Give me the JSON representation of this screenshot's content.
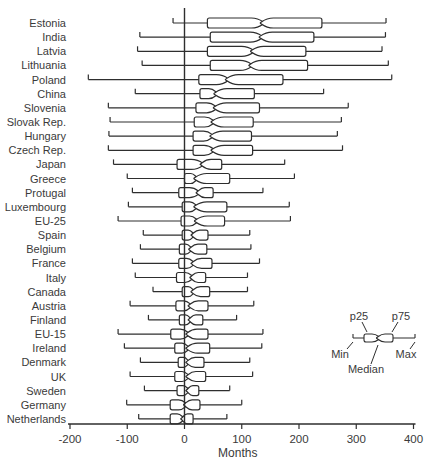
{
  "chart_data": {
    "type": "boxplot",
    "orientation": "horizontal",
    "title": "",
    "xlabel": "Months",
    "ylabel": "",
    "xlim": [
      -200,
      400
    ],
    "x_ticks": [
      -200,
      -100,
      0,
      100,
      200,
      300,
      400
    ],
    "grid": false,
    "zero_reference_line": 0,
    "categories": [
      "Estonia",
      "India",
      "Latvia",
      "Lithuania",
      "Poland",
      "China",
      "Slovenia",
      "Slovak Rep.",
      "Hungary",
      "Czech Rep.",
      "Japan",
      "Greece",
      "Protugal",
      "Luxembourg",
      "EU-25",
      "Spain",
      "Belgium",
      "France",
      "Italy",
      "Canada",
      "Austria",
      "Finland",
      "EU-15",
      "Ireland",
      "Denmark",
      "UK",
      "Sweden",
      "Germany",
      "Netherlands"
    ],
    "boxes": [
      {
        "label": "Estonia",
        "min": -20,
        "p25": 40,
        "median": 136,
        "p75": 240,
        "max": 352
      },
      {
        "label": "India",
        "min": -78,
        "p25": 45,
        "median": 134,
        "p75": 226,
        "max": 351
      },
      {
        "label": "Latvia",
        "min": -82,
        "p25": 40,
        "median": 119,
        "p75": 212,
        "max": 345
      },
      {
        "label": "Lithuania",
        "min": -74,
        "p25": 45,
        "median": 116,
        "p75": 215,
        "max": 356
      },
      {
        "label": "Poland",
        "min": -168,
        "p25": 25,
        "median": 75,
        "p75": 172,
        "max": 362
      },
      {
        "label": "China",
        "min": -86,
        "p25": 27,
        "median": 55,
        "p75": 122,
        "max": 243
      },
      {
        "label": "Slovenia",
        "min": -133,
        "p25": 20,
        "median": 54,
        "p75": 131,
        "max": 286
      },
      {
        "label": "Slovak Rep.",
        "min": -130,
        "p25": 17,
        "median": 50,
        "p75": 120,
        "max": 274
      },
      {
        "label": "Hungary",
        "min": -132,
        "p25": 15,
        "median": 48,
        "p75": 117,
        "max": 267
      },
      {
        "label": "Czech Rep.",
        "min": -133,
        "p25": 15,
        "median": 50,
        "p75": 119,
        "max": 276
      },
      {
        "label": "Japan",
        "min": -124,
        "p25": -13,
        "median": 31,
        "p75": 65,
        "max": 175
      },
      {
        "label": "Greece",
        "min": -100,
        "p25": 0,
        "median": 20,
        "p75": 79,
        "max": 192
      },
      {
        "label": "Protugal",
        "min": -91,
        "p25": -10,
        "median": 24,
        "p75": 50,
        "max": 137
      },
      {
        "label": "Luxembourg",
        "min": -98,
        "p25": -4,
        "median": 20,
        "p75": 74,
        "max": 183
      },
      {
        "label": "EU-25",
        "min": -116,
        "p25": -6,
        "median": 21,
        "p75": 70,
        "max": 185
      },
      {
        "label": "Spain",
        "min": -72,
        "p25": -4,
        "median": 15,
        "p75": 41,
        "max": 114
      },
      {
        "label": "Belgium",
        "min": -77,
        "p25": -9,
        "median": 11,
        "p75": 39,
        "max": 116
      },
      {
        "label": "France",
        "min": -91,
        "p25": -10,
        "median": 15,
        "p75": 48,
        "max": 131
      },
      {
        "label": "Italy",
        "min": -86,
        "p25": -14,
        "median": 13,
        "p75": 37,
        "max": 110
      },
      {
        "label": "Canada",
        "min": -55,
        "p25": -4,
        "median": 15,
        "p75": 44,
        "max": 110
      },
      {
        "label": "Austria",
        "min": -95,
        "p25": -15,
        "median": 10,
        "p75": 41,
        "max": 121
      },
      {
        "label": "Finland",
        "min": -63,
        "p25": -9,
        "median": 10,
        "p75": 32,
        "max": 91
      },
      {
        "label": "EU-15",
        "min": -116,
        "p25": -24,
        "median": 6,
        "p75": 41,
        "max": 137
      },
      {
        "label": "Ireland",
        "min": -105,
        "p25": -17,
        "median": 6,
        "p75": 44,
        "max": 135
      },
      {
        "label": "Denmark",
        "min": -77,
        "p25": -11,
        "median": 6,
        "p75": 34,
        "max": 114
      },
      {
        "label": "UK",
        "min": -95,
        "p25": -17,
        "median": 6,
        "p75": 37,
        "max": 119
      },
      {
        "label": "Sweden",
        "min": -70,
        "p25": -13,
        "median": 6,
        "p75": 25,
        "max": 79
      },
      {
        "label": "Germany",
        "min": -101,
        "p25": -25,
        "median": 2,
        "p75": 27,
        "max": 100
      },
      {
        "label": "Netherlands",
        "min": -80,
        "p25": -25,
        "median": -3,
        "p75": 15,
        "max": 74
      }
    ],
    "legend": {
      "p25_label": "p25",
      "p75_label": "p75",
      "min_label": "Min",
      "max_label": "Max",
      "median_label": "Median",
      "position": "right-middle"
    },
    "colors": {
      "line": "#2e2e2e",
      "text": "#3a3a3a",
      "box_fill": "#ffffff",
      "background": "#ffffff"
    }
  }
}
